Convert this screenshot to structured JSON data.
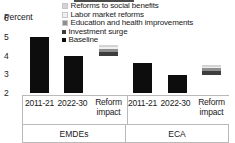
{
  "axis": {
    "percent_label": "Percent",
    "yticks": [
      "6",
      "5",
      "4",
      "3",
      "2"
    ]
  },
  "legend": {
    "items": [
      {
        "label": "Reforms to social benefits",
        "color": "#d4d4d4"
      },
      {
        "label": "Labor market reforms",
        "color": "#efefef"
      },
      {
        "label": "Education and health improvements",
        "color": "#8f8f8f"
      },
      {
        "label": "Investment surge",
        "color": "#3d3d3d"
      },
      {
        "label": "Baseline",
        "color": "#0d0d0d"
      }
    ]
  },
  "categories": {
    "labels": [
      "2011-21",
      "2022-30",
      "Reform impact",
      "2011-21",
      "2022-30",
      "Reform impact"
    ],
    "groups": [
      "EMDEs",
      "ECA"
    ]
  },
  "chart_data": {
    "type": "bar",
    "title": "",
    "xlabel": "",
    "ylabel": "Percent",
    "ylim": [
      2,
      6
    ],
    "yticks": [
      2,
      3,
      4,
      5,
      6
    ],
    "grid": false,
    "legend_position": "top-right",
    "categories": [
      "2011-21",
      "2022-30",
      "Reform impact",
      "2011-21",
      "2022-30",
      "Reform impact"
    ],
    "groups": [
      {
        "name": "EMDEs",
        "bars": [
          {
            "category": "2011-21",
            "type": "baseline",
            "value": 5.0,
            "base": 2.0,
            "top": 5.0
          },
          {
            "category": "2022-30",
            "type": "baseline",
            "value": 4.0,
            "base": 2.0,
            "top": 4.0
          },
          {
            "category": "Reform impact",
            "type": "stacked-floating",
            "base": 4.0,
            "top": 4.55,
            "segments": [
              {
                "name": "Investment surge",
                "value": 0.2,
                "from": 4.0,
                "to": 4.2,
                "color": "#3d3d3d"
              },
              {
                "name": "Education and health improvements",
                "value": 0.15,
                "from": 4.2,
                "to": 4.35,
                "color": "#8f8f8f"
              },
              {
                "name": "Labor market reforms",
                "value": 0.08,
                "from": 4.35,
                "to": 4.43,
                "color": "#efefef"
              },
              {
                "name": "Reforms to social benefits",
                "value": 0.12,
                "from": 4.43,
                "to": 4.55,
                "color": "#d4d4d4"
              }
            ]
          }
        ]
      },
      {
        "name": "ECA",
        "bars": [
          {
            "category": "2011-21",
            "type": "baseline",
            "value": 3.6,
            "base": 2.0,
            "top": 3.6
          },
          {
            "category": "2022-30",
            "type": "baseline",
            "value": 2.95,
            "base": 2.0,
            "top": 2.95
          },
          {
            "category": "Reform impact",
            "type": "stacked-floating",
            "base": 2.95,
            "top": 3.52,
            "segments": [
              {
                "name": "Investment surge",
                "value": 0.22,
                "from": 2.95,
                "to": 3.17,
                "color": "#3d3d3d"
              },
              {
                "name": "Education and health improvements",
                "value": 0.15,
                "from": 3.17,
                "to": 3.32,
                "color": "#8f8f8f"
              },
              {
                "name": "Labor market reforms",
                "value": 0.08,
                "from": 3.32,
                "to": 3.4,
                "color": "#efefef"
              },
              {
                "name": "Reforms to social benefits",
                "value": 0.12,
                "from": 3.4,
                "to": 3.52,
                "color": "#d4d4d4"
              }
            ]
          }
        ]
      }
    ],
    "series": [
      {
        "name": "Baseline",
        "values": [
          5.0,
          4.0,
          null,
          3.6,
          2.95,
          null
        ]
      },
      {
        "name": "Investment surge",
        "values": [
          null,
          null,
          0.2,
          null,
          null,
          0.22
        ]
      },
      {
        "name": "Education and health improvements",
        "values": [
          null,
          null,
          0.15,
          null,
          null,
          0.15
        ]
      },
      {
        "name": "Labor market reforms",
        "values": [
          null,
          null,
          0.08,
          null,
          null,
          0.08
        ]
      },
      {
        "name": "Reforms to social benefits",
        "values": [
          null,
          null,
          0.12,
          null,
          null,
          0.12
        ]
      }
    ]
  }
}
